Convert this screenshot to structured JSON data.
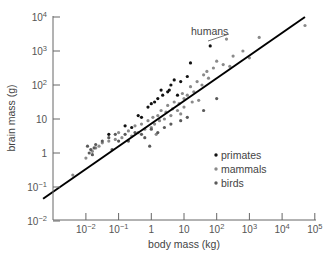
{
  "chart_data": {
    "type": "scatter",
    "title": "",
    "xlabel": "body mass (kg)",
    "ylabel": "brain mass (g)",
    "xscale": "log",
    "yscale": "log",
    "xlim": [
      0.001,
      100000
    ],
    "ylim": [
      0.01,
      10000
    ],
    "x_ticks": [
      0.01,
      0.1,
      1,
      10,
      100,
      1000,
      10000,
      100000
    ],
    "x_tick_labels": [
      "10^-2",
      "10^-1",
      "1",
      "10",
      "10^2",
      "10^3",
      "10^4",
      "10^5"
    ],
    "y_ticks": [
      0.01,
      0.1,
      1,
      10,
      100,
      1000,
      10000
    ],
    "y_tick_labels": [
      "10^-2",
      "10^-1",
      "1",
      "10",
      "10^2",
      "10^3",
      "10^4"
    ],
    "grid": false,
    "legend": {
      "position": "lower right",
      "entries": [
        {
          "label": "primates",
          "color": "#111111"
        },
        {
          "label": "mammals",
          "color": "#8a8a8a"
        },
        {
          "label": "birds",
          "color": "#5a5a5a"
        }
      ]
    },
    "annotations": [
      {
        "text": "humans",
        "points_to": {
          "x_kg": 65,
          "y_g": 1400
        }
      }
    ],
    "fit_line": {
      "label": "allometric fit",
      "slope_log": 0.76,
      "from": {
        "x_kg": 0.00049,
        "y_g": 0.045
      },
      "to": {
        "x_kg": 50000,
        "y_g": 10000
      }
    },
    "series": [
      {
        "name": "primates",
        "color": "#111111",
        "points_log10": [
          [
            1.8,
            3.15
          ],
          [
            1.2,
            2.65
          ],
          [
            0.9,
            2.1
          ],
          [
            0.55,
            1.85
          ],
          [
            0.5,
            1.8
          ],
          [
            0.2,
            1.6
          ],
          [
            0.35,
            1.7
          ],
          [
            0.0,
            1.45
          ],
          [
            -0.1,
            1.35
          ],
          [
            0.7,
            2.15
          ],
          [
            0.3,
            1.85
          ],
          [
            0.1,
            1.5
          ],
          [
            -0.3,
            1.05
          ],
          [
            -0.6,
            0.75
          ],
          [
            -0.8,
            0.8
          ],
          [
            -1.3,
            0.55
          ],
          [
            -0.4,
            1.1
          ],
          [
            0.8,
            1.7
          ],
          [
            0.6,
            2.0
          ],
          [
            1.1,
            2.25
          ]
        ]
      },
      {
        "name": "mammals",
        "color": "#8a8a8a",
        "points_log10": [
          [
            4.7,
            3.75
          ],
          [
            3.3,
            3.4
          ],
          [
            2.3,
            3.35
          ],
          [
            2.5,
            2.85
          ],
          [
            2.2,
            2.6
          ],
          [
            2.4,
            2.55
          ],
          [
            2.0,
            2.7
          ],
          [
            1.9,
            2.5
          ],
          [
            1.7,
            2.4
          ],
          [
            1.75,
            2.2
          ],
          [
            1.6,
            2.3
          ],
          [
            1.4,
            2.1
          ],
          [
            1.55,
            2.0
          ],
          [
            1.3,
            1.8
          ],
          [
            1.2,
            1.95
          ],
          [
            1.1,
            1.7
          ],
          [
            1.0,
            1.6
          ],
          [
            0.95,
            1.75
          ],
          [
            0.85,
            1.45
          ],
          [
            0.8,
            1.25
          ],
          [
            0.7,
            1.5
          ],
          [
            0.65,
            1.3
          ],
          [
            0.6,
            1.1
          ],
          [
            0.5,
            1.4
          ],
          [
            0.45,
            1.2
          ],
          [
            0.4,
            1.0
          ],
          [
            0.3,
            1.25
          ],
          [
            0.25,
            0.95
          ],
          [
            0.2,
            1.1
          ],
          [
            0.1,
            0.85
          ],
          [
            0.05,
            1.05
          ],
          [
            0.0,
            0.75
          ],
          [
            -0.1,
            0.95
          ],
          [
            -0.2,
            0.7
          ],
          [
            -0.3,
            0.85
          ],
          [
            -0.4,
            0.6
          ],
          [
            -0.5,
            0.8
          ],
          [
            -0.6,
            0.5
          ],
          [
            -0.7,
            0.65
          ],
          [
            -0.9,
            0.45
          ],
          [
            -1.0,
            0.6
          ],
          [
            -1.1,
            0.4
          ],
          [
            -1.3,
            0.35
          ],
          [
            -1.5,
            0.3
          ],
          [
            -1.6,
            0.2
          ],
          [
            -1.7,
            0.15
          ],
          [
            -1.8,
            0.05
          ],
          [
            -2.0,
            -0.15
          ],
          [
            -2.4,
            -0.65
          ],
          [
            1.45,
            1.55
          ],
          [
            1.0,
            1.35
          ],
          [
            0.9,
            1.15
          ],
          [
            1.25,
            1.5
          ],
          [
            3.0,
            2.8
          ],
          [
            2.8,
            3.0
          ],
          [
            0.15,
            0.55
          ]
        ]
      },
      {
        "name": "birds",
        "color": "#5a5a5a",
        "points_log10": [
          [
            -1.95,
            0.2
          ],
          [
            -1.9,
            0.0
          ],
          [
            -1.85,
            0.1
          ],
          [
            -1.8,
            -0.05
          ],
          [
            -1.75,
            0.15
          ],
          [
            -1.7,
            0.25
          ],
          [
            -1.5,
            0.35
          ],
          [
            -1.3,
            0.45
          ],
          [
            -1.1,
            0.55
          ],
          [
            -1.0,
            0.35
          ],
          [
            -0.8,
            0.55
          ],
          [
            -0.7,
            0.35
          ],
          [
            -0.5,
            0.6
          ],
          [
            -0.3,
            0.55
          ],
          [
            -0.2,
            0.45
          ],
          [
            0.0,
            0.7
          ],
          [
            0.2,
            0.6
          ],
          [
            0.4,
            0.75
          ],
          [
            0.6,
            0.85
          ],
          [
            0.9,
            0.95
          ],
          [
            1.1,
            1.05
          ],
          [
            1.6,
            1.25
          ],
          [
            2.0,
            1.6
          ],
          [
            -1.2,
            0.1
          ],
          [
            -0.05,
            0.2
          ]
        ]
      }
    ]
  },
  "axes": {
    "x_label": "body mass (kg)",
    "y_label": "brain mass (g)"
  },
  "legend": {
    "primates": "primates",
    "mammals": "mammals",
    "birds": "birds"
  },
  "annotation": {
    "humans": "humans"
  }
}
